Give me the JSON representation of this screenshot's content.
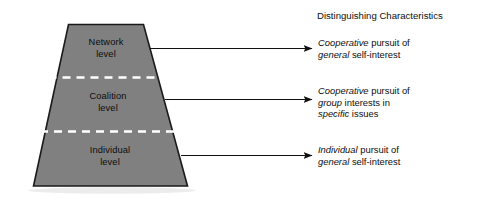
{
  "figure": {
    "type": "layered-trapezoid-diagram",
    "background_color": "#ffffff",
    "shape_fill_color": "#808080",
    "shape_outline_color": "#1a1a1a",
    "divider_color": "#ffffff",
    "arrow_color": "#111111",
    "text_color": "#0d0d0d"
  },
  "pyramid": {
    "name": "levels-trapezoid",
    "levels": [
      {
        "id": "network",
        "label_lines": [
          "Network",
          "level"
        ],
        "order": 1
      },
      {
        "id": "coalition",
        "label_lines": [
          "Coalition",
          "level"
        ],
        "order": 2
      },
      {
        "id": "individual",
        "label_lines": [
          "Individual",
          "level"
        ],
        "order": 3
      }
    ]
  },
  "characteristics": {
    "heading": "Distinguishing Characteristics",
    "items": [
      {
        "id": "network-characteristic",
        "lines": [
          [
            {
              "text": "Cooperative",
              "italic": true
            },
            {
              "text": " pursuit of",
              "italic": false
            }
          ],
          [
            {
              "text": "general",
              "italic": true
            },
            {
              "text": " self-interest",
              "italic": false
            }
          ]
        ]
      },
      {
        "id": "coalition-characteristic",
        "lines": [
          [
            {
              "text": "Cooperative",
              "italic": true
            },
            {
              "text": " pursuit of",
              "italic": false
            }
          ],
          [
            {
              "text": "group",
              "italic": true
            },
            {
              "text": " interests in",
              "italic": false
            }
          ],
          [
            {
              "text": "specific",
              "italic": true
            },
            {
              "text": " issues",
              "italic": false
            }
          ]
        ]
      },
      {
        "id": "individual-characteristic",
        "lines": [
          [
            {
              "text": "Individual",
              "italic": true
            },
            {
              "text": " pursuit of",
              "italic": false
            }
          ],
          [
            {
              "text": "general",
              "italic": true
            },
            {
              "text": " self-interest",
              "italic": false
            }
          ]
        ]
      }
    ]
  },
  "arrows": [
    {
      "id": "arrow-network",
      "from_level": "network",
      "to_characteristic": "network-characteristic"
    },
    {
      "id": "arrow-coalition",
      "from_level": "coalition",
      "to_characteristic": "coalition-characteristic"
    },
    {
      "id": "arrow-individual",
      "from_level": "individual",
      "to_characteristic": "individual-characteristic"
    }
  ]
}
